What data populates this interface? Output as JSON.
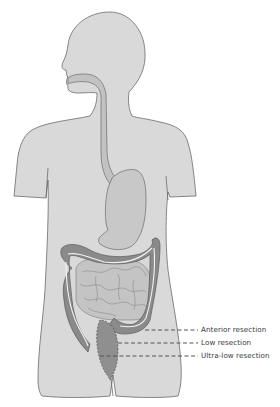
{
  "figure": {
    "colors": {
      "background": "#ffffff",
      "body_fill": "#d9d9d9",
      "body_stroke": "#6b6b6b",
      "gut_fill": "#c2c2c2",
      "colon_fill": "#8a8a8a",
      "colon_highlight": "#f2f2f2",
      "rectum_fill": "#8f8f8f",
      "dash_color": "#555555",
      "label_color": "#3a3a3a"
    }
  },
  "labels": [
    {
      "id": "anterior",
      "text": "Anterior resection",
      "y": 329
    },
    {
      "id": "low",
      "text": "Low resection",
      "y": 342
    },
    {
      "id": "ultra_low",
      "text": "Ultra-low resection",
      "y": 355
    }
  ]
}
